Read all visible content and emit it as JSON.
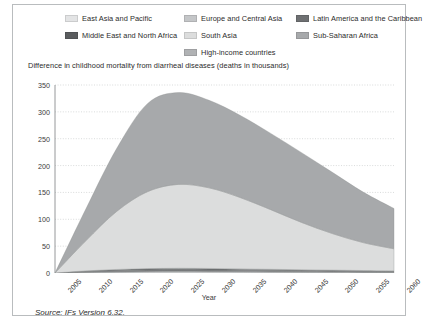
{
  "figure": {
    "source_note": "Source: IFs Version 6.32."
  },
  "legend": {
    "columns": [
      {
        "items": [
          {
            "label": "East Asia and Pacific",
            "color": "#e3e4e5",
            "key": "east-asia-and-pacific"
          },
          {
            "label": "Middle East and North Africa",
            "color": "#5a5c5e",
            "key": "middle-east-and-north-africa"
          }
        ]
      },
      {
        "items": [
          {
            "label": "Europe and Central Asia",
            "color": "#c4c6c8",
            "key": "europe-and-central-asia"
          },
          {
            "label": "South Asia",
            "color": "#dcdddd",
            "key": "south-asia"
          },
          {
            "label": "High-income countries",
            "color": "#b0b2b4",
            "key": "high-income-countries"
          }
        ]
      },
      {
        "items": [
          {
            "label": "Latin America and the Caribbean",
            "color": "#6e7072",
            "key": "latin-america-and-the-caribbean"
          },
          {
            "label": "Sub-Saharan Africa",
            "color": "#a7a9ab",
            "key": "sub-saharan-africa"
          }
        ]
      }
    ]
  },
  "chart_data": {
    "type": "area",
    "stacked": true,
    "title": "Difference in childhood mortality from diarrheal diseases (deaths in thousands)",
    "xlabel": "Year",
    "ylabel": "",
    "grid": true,
    "legend_position": "top",
    "xlim": [
      2005,
      2060
    ],
    "ylim": [
      0,
      350
    ],
    "ytick_step": 50,
    "xtick_step": 5,
    "x": [
      2005,
      2010,
      2015,
      2020,
      2025,
      2030,
      2035,
      2040,
      2045,
      2050,
      2055,
      2060
    ],
    "categories": [
      "2005",
      "2010",
      "2015",
      "2020",
      "2025",
      "2030",
      "2035",
      "2040",
      "2045",
      "2050",
      "2055",
      "2060"
    ],
    "ytick_labels": [
      "0",
      "50",
      "100",
      "150",
      "200",
      "250",
      "300",
      "350"
    ],
    "series": [
      {
        "name": "East Asia and Pacific",
        "color": "#e3e4e5",
        "values": [
          0,
          1.0,
          1.6,
          2.0,
          2.1,
          2.0,
          1.8,
          1.6,
          1.4,
          1.2,
          1.0,
          0.9
        ]
      },
      {
        "name": "Europe and Central Asia",
        "color": "#c4c6c8",
        "values": [
          0,
          0.5,
          0.8,
          1.0,
          1.1,
          1.0,
          0.9,
          0.8,
          0.7,
          0.6,
          0.5,
          0.4
        ]
      },
      {
        "name": "Latin America and the Caribbean",
        "color": "#6e7072",
        "values": [
          0,
          1.2,
          2.0,
          2.5,
          2.7,
          2.6,
          2.4,
          2.1,
          1.9,
          1.7,
          1.5,
          1.3
        ]
      },
      {
        "name": "Middle East and North Africa",
        "color": "#5a5c5e",
        "values": [
          0,
          1.0,
          1.7,
          2.2,
          2.4,
          2.3,
          2.1,
          1.9,
          1.7,
          1.5,
          1.3,
          1.1
        ]
      },
      {
        "name": "High-income countries",
        "color": "#b0b2b4",
        "values": [
          0,
          0.3,
          0.5,
          0.6,
          0.6,
          0.6,
          0.5,
          0.5,
          0.4,
          0.4,
          0.3,
          0.3
        ]
      },
      {
        "name": "South Asia",
        "color": "#dcdddd",
        "values": [
          0,
          56,
          108,
          143,
          156,
          150,
          133,
          111,
          88,
          68,
          52,
          41
        ]
      },
      {
        "name": "Sub-Saharan Africa",
        "color": "#a7a9ab",
        "values": [
          0,
          59,
          117,
          164,
          171,
          163,
          153,
          142,
          130,
          114,
          94,
          75
        ]
      }
    ],
    "totals": [
      0,
      119,
      231,
      315,
      336,
      321,
      294,
      260,
      224,
      187,
      151,
      120
    ]
  }
}
